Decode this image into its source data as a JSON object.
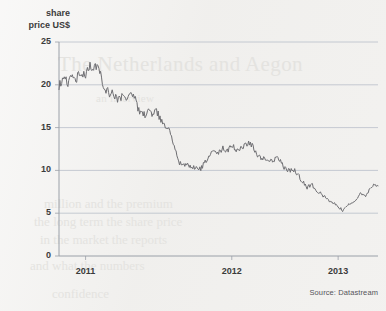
{
  "chart_data": {
    "type": "line",
    "title": "",
    "ylabel": "share price US$",
    "xlabel": "",
    "ylim": [
      0,
      25
    ],
    "yticks": [
      0,
      5,
      10,
      15,
      20,
      25
    ],
    "ytick_labels": [
      "0",
      "5",
      "10",
      "15",
      "20",
      "25"
    ],
    "xtick_labels": [
      "2011",
      "2012",
      "2013"
    ],
    "xlim": [
      "2010-07",
      "2013-07"
    ],
    "grid": true,
    "legend": false,
    "source": "Source: Datastream",
    "series": [
      {
        "name": "share price",
        "units": "US$",
        "x": [
          "2010-07",
          "2010-07",
          "2010-08",
          "2010-08",
          "2010-09",
          "2010-09",
          "2010-10",
          "2010-10",
          "2010-11",
          "2010-11",
          "2010-12",
          "2010-12",
          "2011-01",
          "2011-01",
          "2011-02",
          "2011-02",
          "2011-03",
          "2011-03",
          "2011-04",
          "2011-04",
          "2011-05",
          "2011-05",
          "2011-06",
          "2011-06",
          "2011-07",
          "2011-07",
          "2011-08",
          "2011-08",
          "2011-09",
          "2011-09",
          "2011-10",
          "2011-10",
          "2011-11",
          "2011-11",
          "2011-12",
          "2011-12",
          "2012-01",
          "2012-01",
          "2012-02",
          "2012-02",
          "2012-03",
          "2012-03",
          "2012-04",
          "2012-04",
          "2012-05",
          "2012-05",
          "2012-06",
          "2012-06",
          "2012-07",
          "2012-07",
          "2012-08",
          "2012-08",
          "2012-09",
          "2012-09",
          "2012-10",
          "2012-10",
          "2012-11",
          "2012-11",
          "2012-12",
          "2012-12",
          "2013-01",
          "2013-01",
          "2013-02",
          "2013-02",
          "2013-03",
          "2013-03",
          "2013-04",
          "2013-04",
          "2013-05",
          "2013-05",
          "2013-06",
          "2013-06",
          "2013-07"
        ],
        "values": [
          19.8,
          20.6,
          20.2,
          21.3,
          20.7,
          21.6,
          21.1,
          22.1,
          22.0,
          21.9,
          20.0,
          19.2,
          18.9,
          18.4,
          18.6,
          18.2,
          18.8,
          18.5,
          17.0,
          16.3,
          17.0,
          16.5,
          16.8,
          16.0,
          15.0,
          14.8,
          13.0,
          11.0,
          10.6,
          10.9,
          10.2,
          10.4,
          10.1,
          11.0,
          11.6,
          12.3,
          12.0,
          12.6,
          12.2,
          12.9,
          12.4,
          12.7,
          13.0,
          13.3,
          12.6,
          11.6,
          11.3,
          11.5,
          11.0,
          11.5,
          11.0,
          10.2,
          9.9,
          10.1,
          9.4,
          8.7,
          8.0,
          8.4,
          7.7,
          7.3,
          6.9,
          6.4,
          6.2,
          5.8,
          5.3,
          5.9,
          6.2,
          6.6,
          7.2,
          7.0,
          7.6,
          8.4,
          8.2
        ],
        "notes": "starts near 19.8 in mid-2010, peaks ~22.1 in late 2010, steep fall through 2011 to ~10, rebound to ~13.3 in early 2012, long decline to trough ~5.3 in late 2012, recovery to ~11.3 by mid-2013"
      }
    ],
    "key_points": [
      {
        "label": "start",
        "value": 19.8
      },
      {
        "label": "peak",
        "value": 22.1
      },
      {
        "label": "sharp drop to",
        "value": 10.4
      },
      {
        "label": "rebound peak",
        "value": 13.3
      },
      {
        "label": "trough",
        "value": 5.3
      },
      {
        "label": "end",
        "value": 11.3
      }
    ]
  },
  "axis": {
    "y_title_line1": "share",
    "y_title_line2": "price US$"
  },
  "colors": {
    "line": "#6e6e72",
    "grid": "#b9bfc9",
    "axis": "#9aa0a8",
    "text": "#3b3b3b",
    "paper": "#f1f0ee"
  },
  "ghost_text": {
    "heading": "The Netherlands and Aegon",
    "sub": "an interview",
    "body1": "million and the premium",
    "body2": "the long term the share price",
    "body3": "in the market the reports",
    "body4": "and what the numbers",
    "body5": "confidence"
  }
}
